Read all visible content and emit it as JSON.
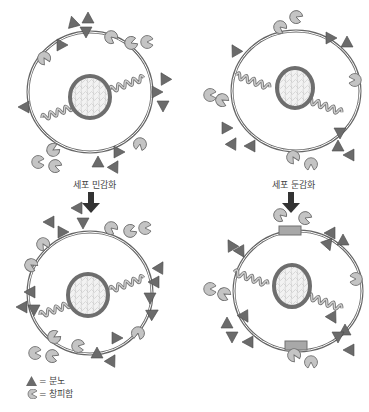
{
  "diagram": {
    "title": "",
    "panels": [
      {
        "id": "top-left",
        "state": "before",
        "label": ""
      },
      {
        "id": "top-right",
        "state": "before",
        "label": ""
      },
      {
        "id": "bottom-left",
        "state": "after-sensitization",
        "label": ""
      },
      {
        "id": "bottom-right",
        "state": "after-desensitization",
        "label": ""
      }
    ],
    "arrows": [
      {
        "from": "top-left",
        "to": "bottom-left",
        "label": "세포 민감화"
      },
      {
        "from": "top-right",
        "to": "bottom-right",
        "label": "세포 둔감화"
      }
    ],
    "legend": [
      {
        "symbol": "triangle",
        "text": "= 분노"
      },
      {
        "symbol": "pacman",
        "text": "= 창피함"
      }
    ],
    "colors": {
      "membrane": "#666666",
      "triangle": "#6b6b6b",
      "pacman": "#bdbdbd",
      "nucleus_ring": "#6e6e6e",
      "nucleus_fill": "#ececec",
      "coil": "#9a9a9a",
      "arrow": "#333333"
    }
  }
}
